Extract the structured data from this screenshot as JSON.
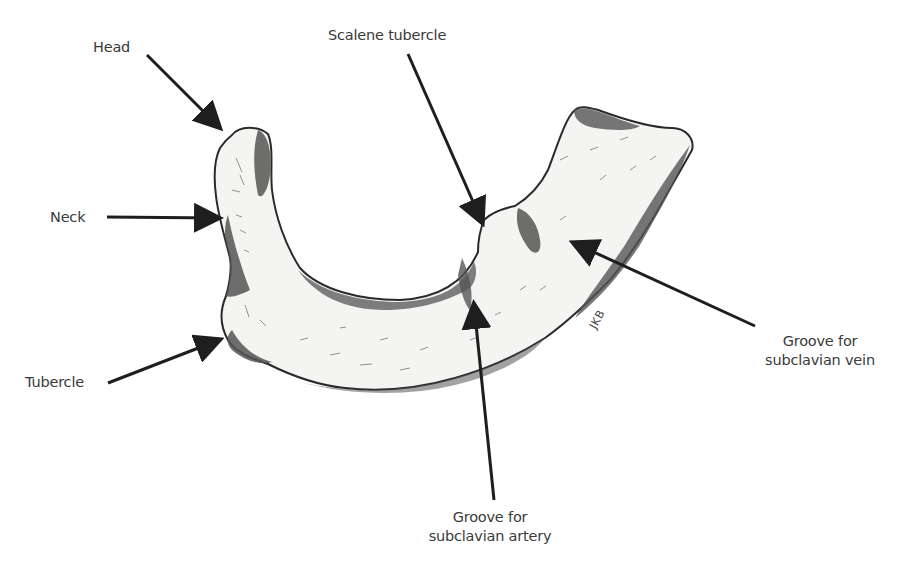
{
  "diagram": {
    "labels": {
      "head": "Head",
      "neck": "Neck",
      "tubercle": "Tubercle",
      "scalene_tubercle": "Scalene tubercle",
      "groove_vein": {
        "line1": "Groove for",
        "line2": "subclavian vein"
      },
      "groove_artery": {
        "line1": "Groove for",
        "line2": "subclavian artery"
      }
    },
    "artist_signature": "JKB",
    "colors": {
      "background": "#ffffff",
      "bone_fill": "#f4f4f2",
      "bone_shadow": "#555555",
      "outline": "#2a2a2a",
      "arrow": "#1e1e1e",
      "text": "#3a3a3a"
    }
  }
}
